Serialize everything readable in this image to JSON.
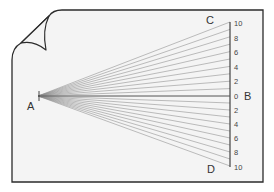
{
  "diagram": {
    "type": "fan-of-lines-to-scale",
    "colors": {
      "background": "#ffffff",
      "page_fill": "#f4f4f4",
      "border": "#2b2b2b",
      "lines": "#8a8a8a",
      "axis": "#333333"
    },
    "points": {
      "A": {
        "label": "A",
        "x": 38,
        "y": 96
      },
      "B": {
        "label": "B"
      },
      "C": {
        "label": "C"
      },
      "D": {
        "label": "D"
      }
    },
    "scale": {
      "x": 230,
      "center_y": 96,
      "unit_px_top": 7.4,
      "unit_px_bottom": 7.0,
      "top_ticks": [
        "10",
        "8",
        "6",
        "4",
        "2",
        "0"
      ],
      "bottom_ticks": [
        "2",
        "4",
        "6",
        "8",
        "10"
      ],
      "line_values_top": [
        0,
        1,
        2,
        3,
        4,
        5,
        6,
        7,
        8,
        9,
        10
      ],
      "line_values_bottom": [
        1,
        2,
        3,
        4,
        5,
        6,
        7,
        8,
        9,
        10
      ]
    },
    "labels": {
      "A": "A",
      "B": "B",
      "C": "C",
      "D": "D",
      "t10_top": "10",
      "t8_top": "8",
      "t6_top": "6",
      "t4_top": "4",
      "t2_top": "2",
      "t0": "0",
      "t2_bot": "2",
      "t4_bot": "4",
      "t6_bot": "6",
      "t8_bot": "8",
      "t10_bot": "10"
    }
  }
}
